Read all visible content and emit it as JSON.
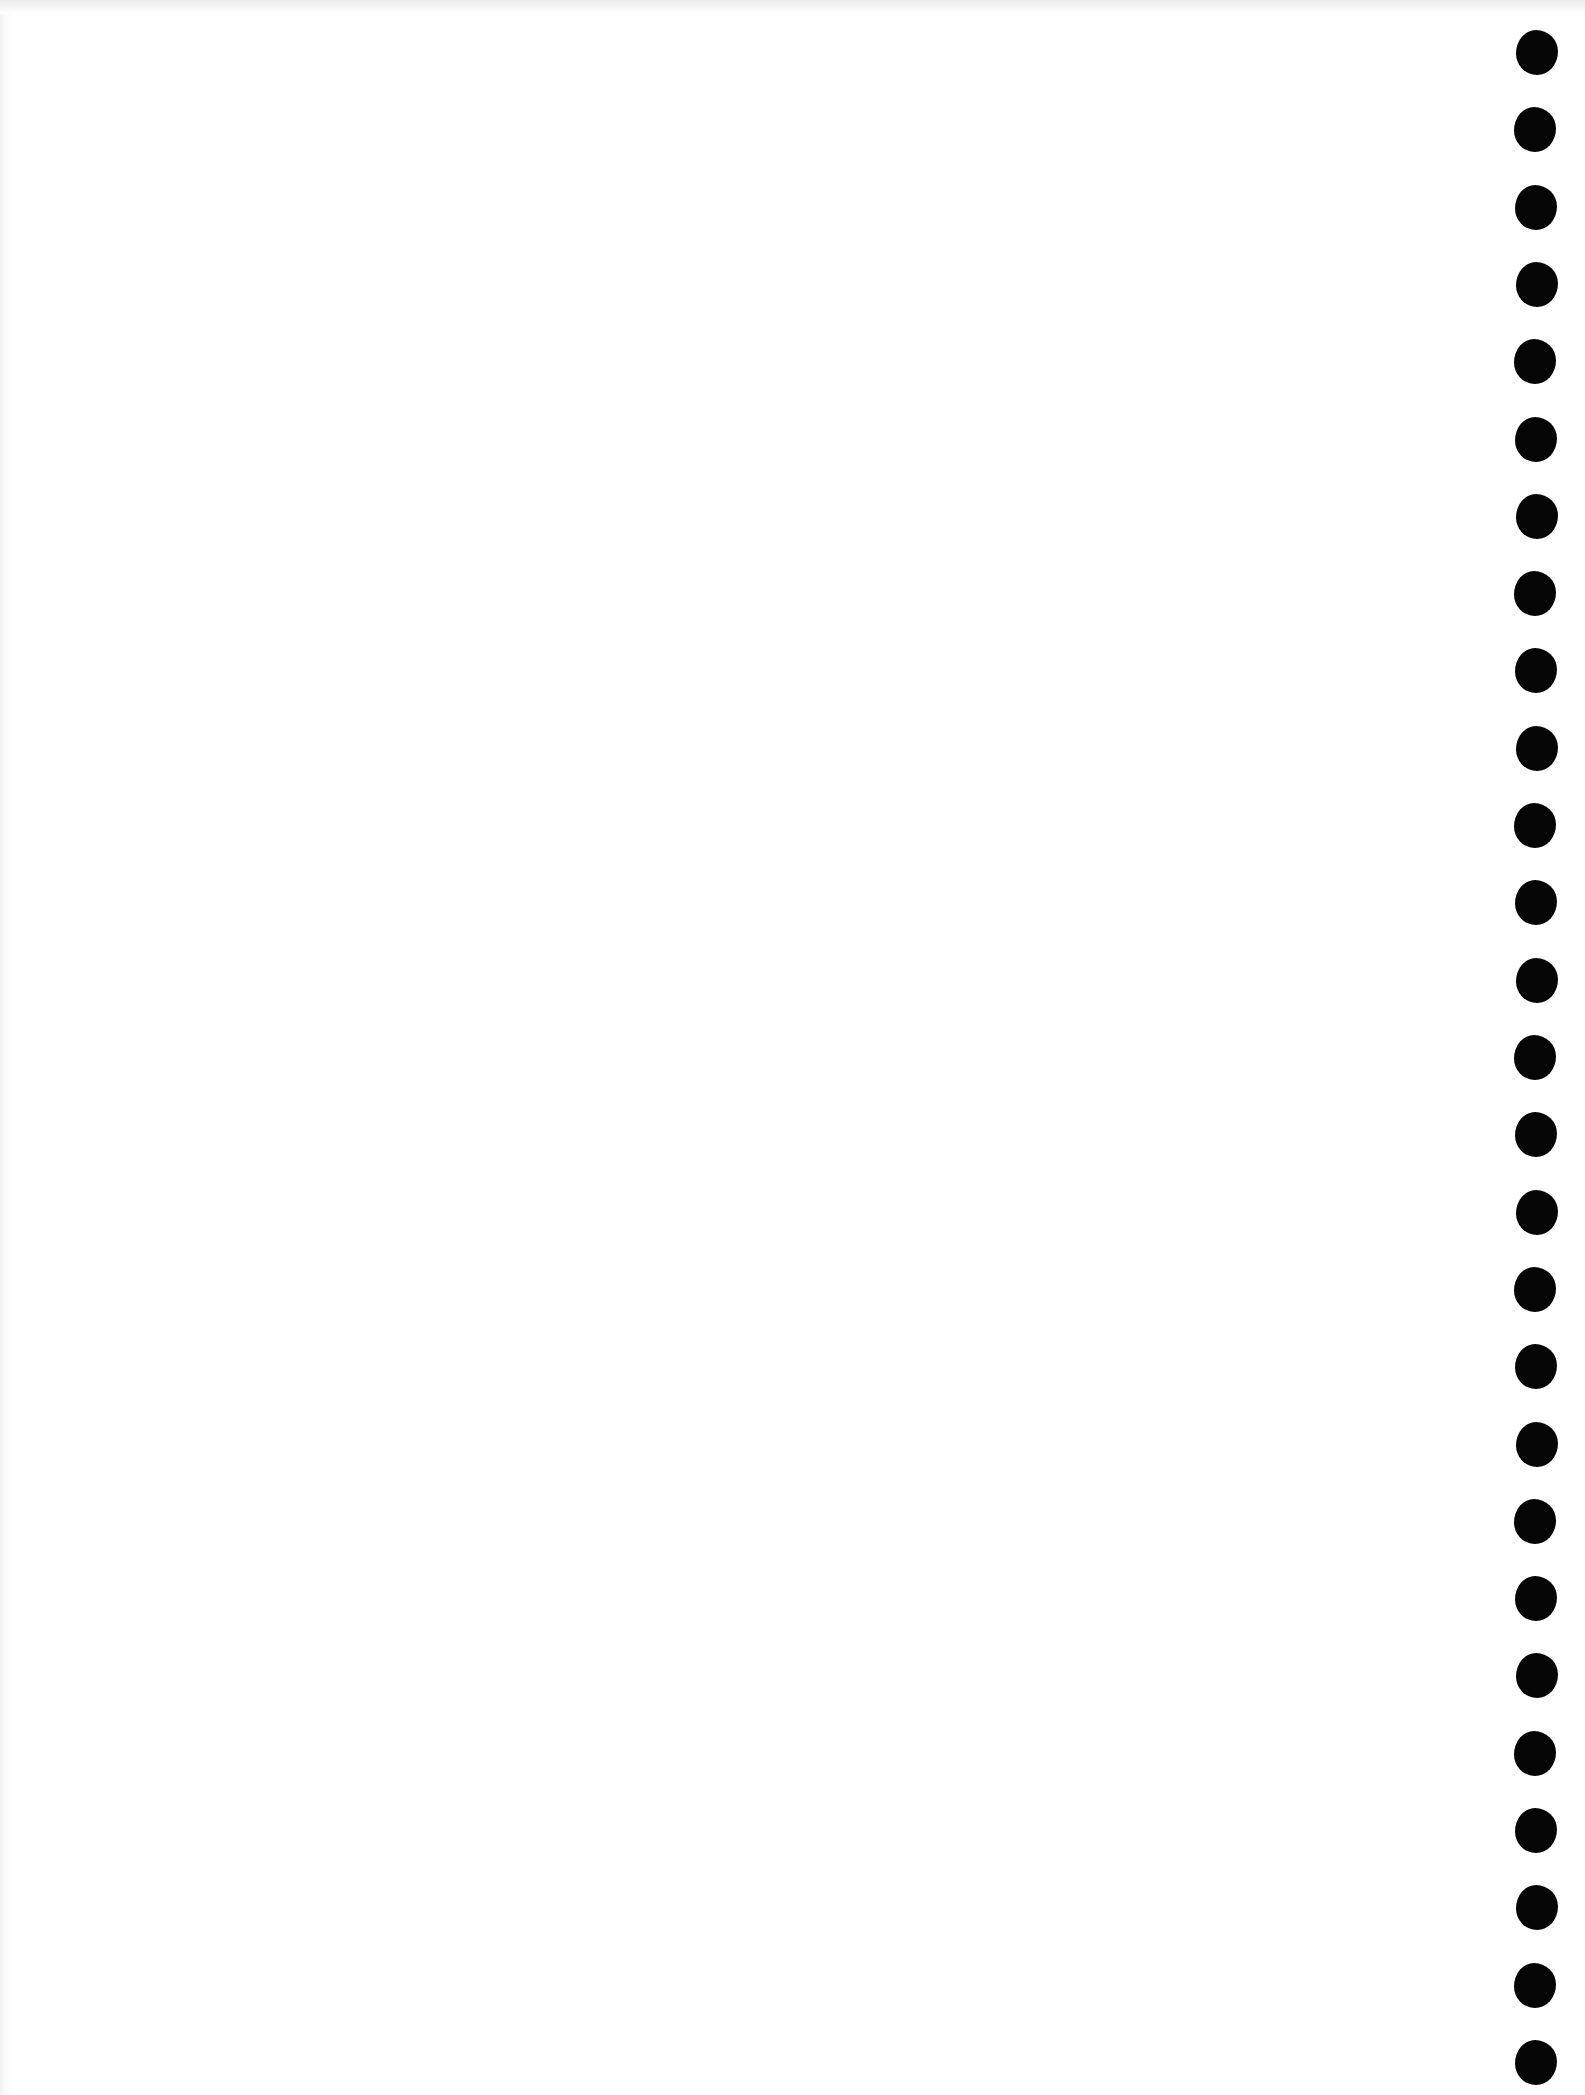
{
  "page": {
    "type": "blank notebook page",
    "background_color": "#ffffff",
    "text": ""
  },
  "binding": {
    "side": "right",
    "hole_color": "#050505",
    "hole_count": 27,
    "hole_positions_y": [
      55,
      130,
      206,
      282,
      357,
      433,
      508,
      584,
      659,
      735,
      810,
      886,
      961,
      1037,
      1112,
      1188,
      1263,
      1339,
      1414,
      1490,
      1565,
      1641,
      1716,
      1792,
      1867,
      1943,
      2040
    ]
  }
}
